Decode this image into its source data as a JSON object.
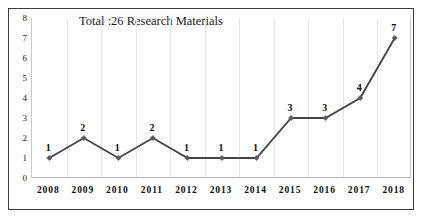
{
  "chart_data": {
    "type": "line",
    "title": "Total :26 Research Materials",
    "xlabel": "",
    "ylabel": "",
    "categories": [
      "2008",
      "2009",
      "2010",
      "2011",
      "2012",
      "2013",
      "2014",
      "2015",
      "2016",
      "2017",
      "2018"
    ],
    "values": [
      1,
      2,
      1,
      2,
      1,
      1,
      1,
      3,
      3,
      4,
      7
    ],
    "point_labels": [
      "1",
      "2",
      "1",
      "2",
      "1",
      "1",
      "1",
      "3",
      "3",
      "4",
      "7"
    ],
    "ylim": [
      0,
      8
    ],
    "y_ticks": [
      "8",
      "7",
      "6",
      "5",
      "4",
      "3",
      "2",
      "1",
      "0"
    ],
    "y_tick_values": [
      8,
      7,
      6,
      5,
      4,
      3,
      2,
      1,
      0
    ],
    "grid": "vertical-only",
    "legend": "none",
    "series_name": "Research Materials",
    "total": 26,
    "colors": {
      "line": "#444444",
      "marker": "#595959",
      "gridline": "#e6e6e6",
      "axis": "#b5b5b5",
      "frame": "#3a3a3a",
      "text": "#0d0d0d",
      "background": "#ffffff"
    }
  }
}
